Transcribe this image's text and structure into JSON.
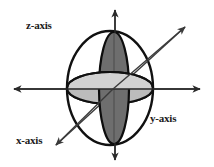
{
  "figure": {
    "kind": "3d-coordinate-axes-with-ellipsoid",
    "background_color": "#ffffff",
    "width": 214,
    "height": 167,
    "origin": {
      "x": 113,
      "y": 89
    }
  },
  "labels": {
    "z": "z-axis",
    "x": "x-axis",
    "y": "y-axis",
    "color": "#1a1a1a"
  },
  "axes": [
    {
      "name": "z-axis",
      "orientation": "vertical",
      "stroke": "#2a2a2a",
      "stroke_width": 1.4,
      "double_headed": true,
      "start": {
        "x": 115,
        "y": 10
      },
      "end": {
        "x": 115,
        "y": 160
      }
    },
    {
      "name": "y-axis",
      "orientation": "horizontal",
      "stroke": "#2a2a2a",
      "stroke_width": 1.4,
      "double_headed": true,
      "start": {
        "x": 14,
        "y": 89
      },
      "end": {
        "x": 200,
        "y": 89
      }
    },
    {
      "name": "x-axis",
      "orientation": "diagonal",
      "stroke": "#3a3a3a",
      "stroke_width": 1.4,
      "double_headed": true,
      "start": {
        "x": 185,
        "y": 27
      },
      "end": {
        "x": 56,
        "y": 145
      }
    }
  ],
  "shapes": {
    "outer_ellipse": {
      "label": "outer-ellipsoid-outline",
      "cx": 110,
      "cy": 88,
      "rx": 43,
      "ry": 57,
      "fill": "#ffffff",
      "stroke": "#111111",
      "stroke_width": 2.4
    },
    "vertical_lens": {
      "label": "vertical-cross-section",
      "cx": 114,
      "cy": 88,
      "rx": 15,
      "ry": 56,
      "fill": "#6e6e6e",
      "stroke": "#0d0d0d",
      "stroke_width": 2.2
    },
    "horizontal_ellipse": {
      "label": "equatorial-plane",
      "cx": 110,
      "cy": 88,
      "rx": 43,
      "ry": 16,
      "fill": "#d2d2d2",
      "fill_shadow": "#bcbcbc",
      "stroke": "#111111",
      "stroke_width": 2.2
    }
  }
}
